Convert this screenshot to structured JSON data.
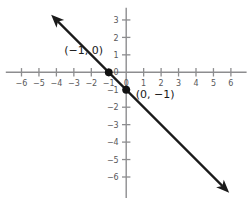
{
  "chart_data": {
    "type": "line",
    "title": "",
    "xlabel": "",
    "ylabel": "",
    "xlim": [
      -6.9,
      6.9
    ],
    "ylim": [
      -7.2,
      3.7
    ],
    "grid": false,
    "legend": null,
    "equation": "y = -x - 1",
    "slope": -1,
    "y_intercept": -1,
    "x_intercept": -1,
    "series": [
      {
        "name": "line",
        "x": [
          -4.3,
          5.9
        ],
        "values": [
          3.3,
          -6.9
        ],
        "arrow_start": true,
        "arrow_end": true,
        "color": "#1a1a1a"
      }
    ],
    "points": [
      {
        "label": "(−1, 0)",
        "x": -1,
        "y": 0,
        "label_dx": -2.55,
        "label_dy": 1.05
      },
      {
        "label": "(0, −1)",
        "x": 0,
        "y": -1,
        "label_dx": 0.55,
        "label_dy": -0.45
      }
    ],
    "x_ticks": [
      -6,
      -5,
      -4,
      -3,
      -2,
      -1,
      0,
      1,
      2,
      3,
      4,
      5,
      6
    ],
    "x_tick_labels": [
      "−6",
      "−5",
      "−4",
      "−3",
      "−2",
      "−1",
      "0",
      "1",
      "2",
      "3",
      "4",
      "5",
      "6"
    ],
    "y_ticks": [
      -6,
      -5,
      -4,
      -3,
      -2,
      -1,
      0,
      1,
      2,
      3
    ],
    "y_tick_labels": [
      "−6",
      "−5",
      "−4",
      "−3",
      "−2",
      "−1",
      "0",
      "1",
      "2",
      "3"
    ],
    "axis_color": "#8d8d8f",
    "tick_label_color": "#58585a",
    "point_label_color": "#1a1a1a",
    "background": "#ffffff"
  }
}
